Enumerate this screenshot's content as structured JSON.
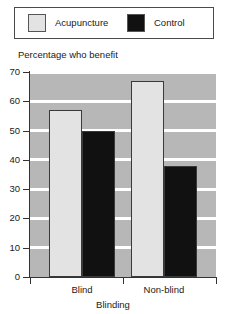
{
  "chart_data": {
    "type": "bar",
    "title": "",
    "xlabel": "Blinding",
    "ylabel": "Percentage who benefit",
    "categories": [
      "Blind",
      "Non-blind"
    ],
    "series": [
      {
        "name": "Acupuncture",
        "color": "#e3e3e3",
        "values": [
          57,
          67
        ]
      },
      {
        "name": "Control",
        "color": "#111111",
        "values": [
          50,
          38
        ]
      }
    ],
    "ylim": [
      0,
      70
    ],
    "yticks": [
      0,
      10,
      20,
      30,
      40,
      50,
      60,
      70
    ],
    "ytick_labels": [
      "0",
      "10",
      "20",
      "30",
      "40",
      "50",
      "60",
      "70"
    ],
    "grid": "horizontal-white-on-gray",
    "legend_position": "top"
  },
  "legend": {
    "entries": [
      {
        "label": "Acupuncture",
        "swatch": "#e3e3e3"
      },
      {
        "label": "Control",
        "swatch": "#111111"
      }
    ]
  },
  "axes": {
    "y_title": "Percentage who benefit",
    "x_title": "Blinding"
  }
}
